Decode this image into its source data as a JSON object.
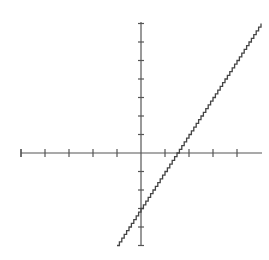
{
  "chart_data": {
    "type": "line",
    "title": "",
    "xlabel": "",
    "ylabel": "",
    "equation": "y = 2x - 3",
    "grid": false,
    "legend": null,
    "xlim": [
      -5,
      5
    ],
    "ylim": [
      -5,
      7
    ],
    "x_ticks": [
      -5,
      -4,
      -3,
      -2,
      -1,
      1,
      2,
      3,
      4
    ],
    "y_ticks": [
      -5,
      -4,
      -3,
      -2,
      -1,
      1,
      2,
      3,
      4,
      5,
      6,
      7
    ],
    "tick_labels_shown": false,
    "series": [
      {
        "name": "line",
        "x": [
          -1,
          0,
          1.5,
          5
        ],
        "y": [
          -5,
          -3,
          0,
          7
        ]
      }
    ],
    "x_intercept": 1.5,
    "y_intercept": -3,
    "slope": 2
  },
  "layout": {
    "origin_px": [
      141,
      153
    ],
    "x_unit_px": 24,
    "y_unit_px": 18.5,
    "x_axis_px": [
      21,
      262
    ],
    "y_axis_px": [
      22,
      245
    ],
    "line_color": "#444444",
    "axis_color": "#555555"
  }
}
